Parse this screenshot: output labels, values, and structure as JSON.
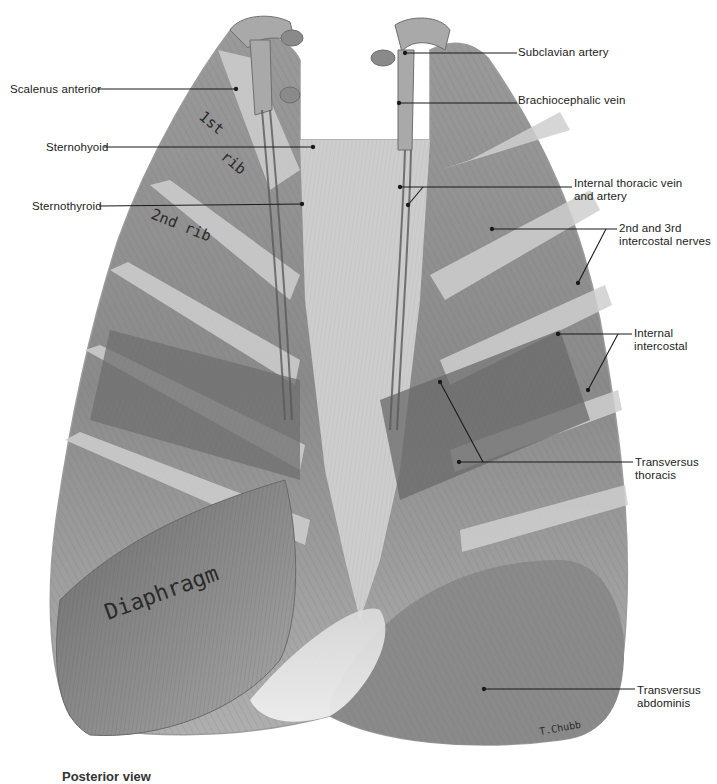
{
  "figure": {
    "signature": "T.Chubb",
    "caption_partial": "Posterior view",
    "rib_annotations": [
      "1st",
      "rib",
      "2nd rib"
    ],
    "diaphragm_annotation": "Diaphragm"
  },
  "labels": {
    "left": [
      {
        "id": "scalenus-anterior",
        "text": "Scalenus anterior",
        "x": 10,
        "y": 83,
        "line": [
          97,
          89,
          236,
          89
        ]
      },
      {
        "id": "sternohyoid",
        "text": "Sternohyoid",
        "x": 46,
        "y": 141,
        "line": [
          104,
          147,
          313,
          147
        ]
      },
      {
        "id": "sternothyroid",
        "text": "Sternothyroid",
        "x": 32,
        "y": 200,
        "line": [
          99,
          206,
          302,
          204
        ]
      }
    ],
    "right": [
      {
        "id": "subclavian-artery",
        "lines": [
          "Subclavian artery"
        ],
        "x": 518,
        "y": 46,
        "line": [
          405,
          53,
          517,
          53
        ]
      },
      {
        "id": "brachiocephalic-vein",
        "lines": [
          "Brachiocephalic vein"
        ],
        "x": 518,
        "y": 94,
        "line": [
          399,
          103,
          517,
          103
        ]
      },
      {
        "id": "internal-thoracic-vein-artery",
        "lines": [
          "Internal thoracic vein",
          "and artery"
        ],
        "x": 574,
        "y": 177,
        "line": [
          400,
          187,
          572,
          187
        ],
        "branch": [
          423,
          187,
          408,
          205
        ]
      },
      {
        "id": "intercostal-nerves",
        "lines": [
          "2nd and 3rd",
          "intercostal nerves"
        ],
        "x": 619,
        "y": 222,
        "line": [
          492,
          229,
          617,
          229
        ],
        "branch": [
          606,
          229,
          578,
          283
        ]
      },
      {
        "id": "internal-intercostal",
        "lines": [
          "Internal",
          "intercostal"
        ],
        "x": 634,
        "y": 330,
        "line": [
          558,
          334,
          632,
          334
        ],
        "branch": [
          618,
          334,
          588,
          390
        ]
      },
      {
        "id": "transversus-thoracis",
        "lines": [
          "Transversus",
          "thoracis"
        ],
        "x": 635,
        "y": 460,
        "line": [
          459,
          462,
          633,
          462
        ],
        "branch": [
          483,
          462,
          440,
          382
        ]
      },
      {
        "id": "transversus-abdominis",
        "lines": [
          "Transversus",
          "abdominis"
        ],
        "x": 637,
        "y": 688,
        "line": [
          484,
          689,
          635,
          689
        ]
      }
    ]
  },
  "colors": {
    "muscle_dark": "#5a5a5a",
    "muscle_mid": "#8c8c8c",
    "muscle_light": "#c9c9c9",
    "rib": "#d6d6d6",
    "leader": "#1a1a1a",
    "text": "#222222"
  }
}
